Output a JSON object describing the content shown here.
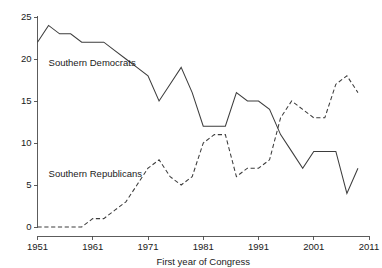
{
  "chart_data": {
    "type": "line",
    "title": "",
    "subtitle": "",
    "xlabel": "First year of Congress",
    "ylabel": "",
    "xlim": [
      1951,
      2011
    ],
    "ylim": [
      0,
      25
    ],
    "grid": false,
    "legend_position": "inline-annotation",
    "x_ticks": [
      "1951",
      "1961",
      "1971",
      "1981",
      "1991",
      "2001",
      "2011"
    ],
    "x_tick_values": [
      1951,
      1961,
      1971,
      1981,
      1991,
      2001,
      2011
    ],
    "y_ticks": [
      "0",
      "5",
      "10",
      "15",
      "20",
      "25"
    ],
    "y_tick_values": [
      0,
      5,
      10,
      15,
      20,
      25
    ],
    "x": [
      1951,
      1953,
      1955,
      1957,
      1959,
      1961,
      1963,
      1965,
      1967,
      1969,
      1971,
      1973,
      1975,
      1977,
      1979,
      1981,
      1983,
      1985,
      1987,
      1989,
      1991,
      1993,
      1995,
      1997,
      1999,
      2001,
      2003,
      2005,
      2007,
      2009
    ],
    "series": [
      {
        "name": "Southern Democrats",
        "style": "solid",
        "color": "#3d3d3d",
        "label_x": 1953,
        "label_y": 19.2,
        "values": [
          22,
          24,
          23,
          23,
          22,
          22,
          22,
          21,
          20,
          19,
          18,
          15,
          17,
          19,
          16,
          12,
          12,
          12,
          16,
          15,
          15,
          14,
          11,
          9,
          7,
          9,
          9,
          9,
          4,
          7
        ]
      },
      {
        "name": "Southern Republicans",
        "style": "dashed",
        "color": "#3d3d3d",
        "label_x": 1953,
        "label_y": 6.0,
        "values": [
          0,
          0,
          0,
          0,
          0,
          1,
          1,
          2,
          3,
          5,
          7,
          8,
          6,
          5,
          6,
          10,
          11,
          11,
          6,
          7,
          7,
          8,
          13,
          15,
          14,
          13,
          13,
          17,
          18,
          16
        ]
      }
    ]
  },
  "annotations": {
    "democrats_label": "Southern Democrats",
    "republicans_label": "Southern Republicans"
  }
}
